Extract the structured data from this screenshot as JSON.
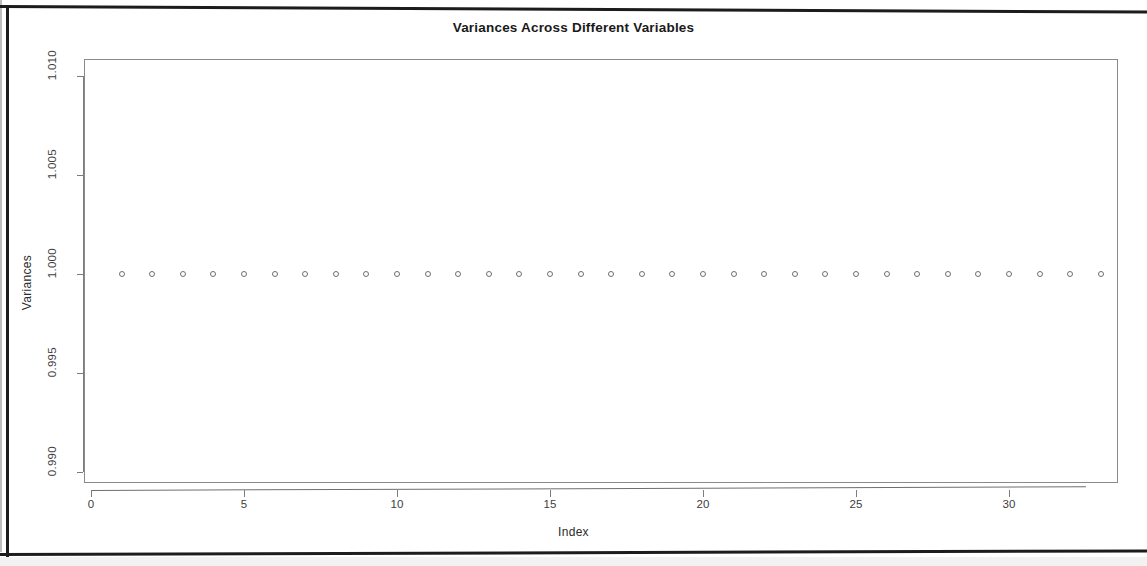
{
  "chart_data": {
    "type": "scatter",
    "title": "Variances Across Different Variables",
    "xlabel": "Index",
    "ylabel": "Variances",
    "grid": false,
    "legend": null,
    "marker": "open-circle",
    "xlim": [
      0,
      34
    ],
    "ylim": [
      0.99,
      1.01
    ],
    "xticks": [
      0,
      5,
      10,
      15,
      20,
      25,
      30
    ],
    "xtick_labels": [
      "0",
      "5",
      "10",
      "15",
      "20",
      "25",
      "30"
    ],
    "yticks": [
      0.99,
      0.995,
      1.0,
      1.005,
      1.01
    ],
    "ytick_labels": [
      "0.990",
      "0.995",
      "1.000",
      "1.005",
      "1.010"
    ],
    "x": [
      1,
      2,
      3,
      4,
      5,
      6,
      7,
      8,
      9,
      10,
      11,
      12,
      13,
      14,
      15,
      16,
      17,
      18,
      19,
      20,
      21,
      22,
      23,
      24,
      25,
      26,
      27,
      28,
      29,
      30,
      31,
      32,
      33
    ],
    "values": [
      1.0,
      1.0,
      1.0,
      1.0,
      1.0,
      1.0,
      1.0,
      1.0,
      1.0,
      1.0,
      1.0,
      1.0,
      1.0,
      1.0,
      1.0,
      1.0,
      1.0,
      1.0,
      1.0,
      1.0,
      1.0,
      1.0,
      1.0,
      1.0,
      1.0,
      1.0,
      1.0,
      1.0,
      1.0,
      1.0,
      1.0,
      1.0,
      1.0
    ],
    "n_points": 33,
    "series": [
      {
        "name": "Variances",
        "values": [
          1.0,
          1.0,
          1.0,
          1.0,
          1.0,
          1.0,
          1.0,
          1.0,
          1.0,
          1.0,
          1.0,
          1.0,
          1.0,
          1.0,
          1.0,
          1.0,
          1.0,
          1.0,
          1.0,
          1.0,
          1.0,
          1.0,
          1.0,
          1.0,
          1.0,
          1.0,
          1.0,
          1.0,
          1.0,
          1.0,
          1.0,
          1.0,
          1.0
        ]
      }
    ],
    "colors": {
      "marker_stroke": "#6e6e6e",
      "axis": "#7d7d7d",
      "panel_border": "#8a8a8a",
      "title_text": "#1a1a1a",
      "tick_text": "#3d3d3d",
      "page_frame": "#1c1c1c",
      "background": "#ffffff"
    }
  }
}
